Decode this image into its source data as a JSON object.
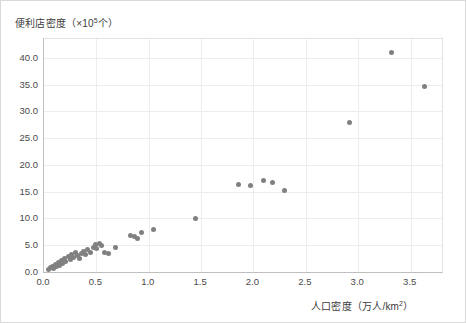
{
  "chart": {
    "ylabel_text": "便利店密度（×10",
    "ylabel_sup": "5",
    "ylabel_tail": "个）",
    "xlabel_text": "人口密度（万人/km",
    "xlabel_sup": "2",
    "xlabel_tail": "）",
    "marker_color": "#808080",
    "grid_color": "#ededed",
    "axis_color": "#bfbfbf"
  },
  "chart_data": {
    "type": "scatter",
    "title": "",
    "xlabel": "人口密度（万人/km²）",
    "ylabel": "便利店密度（×10⁵个）",
    "xlim": [
      0.0,
      3.8
    ],
    "ylim": [
      0.0,
      43.5
    ],
    "grid": true,
    "legend": null,
    "xticks": [
      "0.0",
      "0.5",
      "1.0",
      "1.5",
      "2.0",
      "2.5",
      "3.0",
      "3.5"
    ],
    "xtick_values": [
      0.0,
      0.5,
      1.0,
      1.5,
      2.0,
      2.5,
      3.0,
      3.5
    ],
    "yticks": [
      "0.0",
      "5.0",
      "10.0",
      "15.0",
      "20.0",
      "25.0",
      "30.0",
      "35.0",
      "40.0"
    ],
    "ytick_values": [
      0.0,
      5.0,
      10.0,
      15.0,
      20.0,
      25.0,
      30.0,
      35.0,
      40.0
    ],
    "points": [
      [
        0.04,
        0.5
      ],
      [
        0.06,
        0.8
      ],
      [
        0.08,
        1.1
      ],
      [
        0.09,
        0.6
      ],
      [
        0.11,
        1.4
      ],
      [
        0.12,
        1.0
      ],
      [
        0.14,
        1.8
      ],
      [
        0.15,
        1.3
      ],
      [
        0.17,
        2.2
      ],
      [
        0.18,
        1.6
      ],
      [
        0.2,
        2.5
      ],
      [
        0.21,
        1.9
      ],
      [
        0.23,
        2.9
      ],
      [
        0.25,
        2.3
      ],
      [
        0.26,
        3.3
      ],
      [
        0.28,
        2.7
      ],
      [
        0.3,
        3.6
      ],
      [
        0.32,
        3.0
      ],
      [
        0.34,
        2.6
      ],
      [
        0.36,
        3.4
      ],
      [
        0.38,
        3.9
      ],
      [
        0.4,
        3.2
      ],
      [
        0.42,
        4.2
      ],
      [
        0.44,
        3.7
      ],
      [
        0.47,
        4.6
      ],
      [
        0.49,
        5.1
      ],
      [
        0.5,
        4.4
      ],
      [
        0.53,
        5.4
      ],
      [
        0.55,
        4.9
      ],
      [
        0.58,
        3.6
      ],
      [
        0.62,
        3.4
      ],
      [
        0.68,
        4.6
      ],
      [
        0.83,
        6.9
      ],
      [
        0.86,
        6.6
      ],
      [
        0.89,
        6.3
      ],
      [
        0.93,
        7.3
      ],
      [
        1.05,
        8.0
      ],
      [
        1.45,
        10.0
      ],
      [
        1.86,
        16.3
      ],
      [
        1.97,
        16.2
      ],
      [
        2.1,
        17.0
      ],
      [
        2.18,
        16.8
      ],
      [
        2.3,
        15.2
      ],
      [
        2.92,
        27.9
      ],
      [
        3.32,
        41.0
      ],
      [
        3.63,
        34.6
      ]
    ]
  }
}
